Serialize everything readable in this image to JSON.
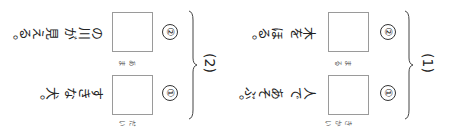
{
  "worksheet": {
    "groups": [
      {
        "label": "(1)",
        "items": [
          {
            "number": "①",
            "reading": "きかい",
            "after": "人で あそぶ。"
          },
          {
            "number": "②",
            "reading": "まる",
            "after": "木を ほる。"
          }
        ]
      },
      {
        "label": "(2)",
        "items": [
          {
            "number": "①",
            "reading": "だい",
            "after": "すきな 犬。"
          },
          {
            "number": "②",
            "reading": "あま",
            "after": "の川が 見える。"
          }
        ]
      }
    ],
    "colors": {
      "box_border": "#9a9a9a",
      "text": "#222222",
      "background": "#ffffff"
    }
  }
}
